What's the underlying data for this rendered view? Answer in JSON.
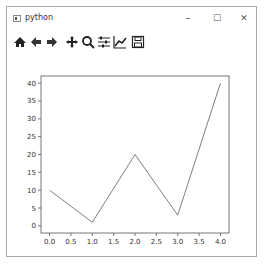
{
  "window": {
    "title": "python",
    "controls": {
      "minimize": "–",
      "maximize": "☐",
      "close": "✕"
    }
  },
  "toolbar": {
    "tools": [
      {
        "name": "home",
        "icon": "home-icon"
      },
      {
        "name": "back",
        "icon": "arrow-left-icon"
      },
      {
        "name": "forward",
        "icon": "arrow-right-icon"
      },
      {
        "name": "pan",
        "icon": "move-icon"
      },
      {
        "name": "zoom",
        "icon": "magnifier-icon"
      },
      {
        "name": "subplots",
        "icon": "sliders-icon"
      },
      {
        "name": "customize",
        "icon": "line-chart-icon"
      },
      {
        "name": "save",
        "icon": "floppy-disk-icon"
      }
    ]
  },
  "chart_data": {
    "type": "line",
    "title": "",
    "xlabel": "",
    "ylabel": "",
    "x": [
      0,
      1,
      2,
      3,
      4
    ],
    "series": [
      {
        "name": "",
        "values": [
          10,
          1,
          20,
          3,
          40
        ],
        "color": "#7f7f7f"
      }
    ],
    "xlim": [
      -0.2,
      4.2
    ],
    "ylim": [
      -2,
      42
    ],
    "xticks": [
      "0.0",
      "0.5",
      "1.0",
      "1.5",
      "2.0",
      "2.5",
      "3.0",
      "3.5",
      "4.0"
    ],
    "yticks": [
      "0",
      "5",
      "10",
      "15",
      "20",
      "25",
      "30",
      "35",
      "40"
    ],
    "grid": false,
    "legend": null
  }
}
